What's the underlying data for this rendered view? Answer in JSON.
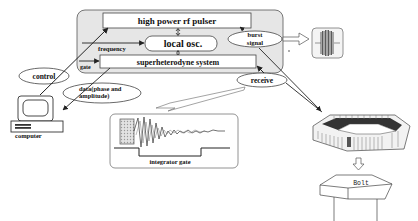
{
  "diagram": {
    "controller_panel": {
      "pulser_label": "high power rf pulser",
      "local_osc_label": "local osc.",
      "superhet_label": "superheterodyne system",
      "frequency_label": "frequency",
      "gate_label": "gate",
      "burst_signal_label_line1": "burst",
      "burst_signal_label_line2": "signal"
    },
    "receive_label": "receive",
    "control_label": "control",
    "data_label_line1": "data(phase and",
    "data_label_line2": "amplitude)",
    "computer_label": "computer",
    "integrator_gate_label": "integrator gate",
    "bolt_label": "Bolt",
    "colors": {
      "panel_fill": "#e6e6e6",
      "stroke": "#333333",
      "box_fill": "#ffffff",
      "hatch": "#bbbbbb"
    }
  }
}
